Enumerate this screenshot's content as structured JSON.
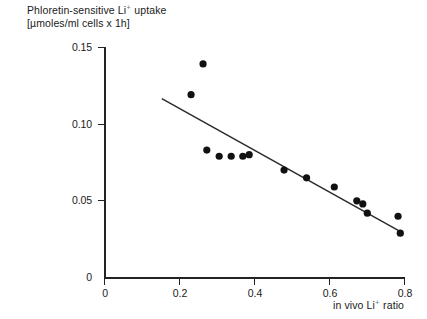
{
  "chart_data": {
    "type": "scatter",
    "title": "",
    "ylabel_line1": "Phloretin-sensitive Li",
    "ylabel_line1_sup": "+",
    "ylabel_line1_tail": "uptake",
    "ylabel_line2": "[µmoles/ml cells x 1h]",
    "xlabel_lead": "in vivo Li",
    "xlabel_sup": "+",
    "xlabel_tail": "ratio",
    "xlim": [
      0,
      0.8
    ],
    "ylim": [
      0,
      0.15
    ],
    "xticks": [
      0,
      0.2,
      0.4,
      0.6,
      0.8
    ],
    "xtick_labels": [
      "0",
      "0.2",
      "0.4",
      "0.6",
      "0.8"
    ],
    "yticks": [
      0,
      0.05,
      0.1,
      0.15
    ],
    "ytick_labels": [
      "0",
      "0.05",
      "0.10",
      "0.15"
    ],
    "grid": false,
    "legend": "none",
    "marker": "filled-circle",
    "marker_color": "#111111",
    "line_color": "#2b2b2b",
    "points": [
      {
        "x": 0.23,
        "y": 0.119
      },
      {
        "x": 0.262,
        "y": 0.139
      },
      {
        "x": 0.272,
        "y": 0.083
      },
      {
        "x": 0.305,
        "y": 0.079
      },
      {
        "x": 0.337,
        "y": 0.079
      },
      {
        "x": 0.368,
        "y": 0.079
      },
      {
        "x": 0.385,
        "y": 0.08
      },
      {
        "x": 0.478,
        "y": 0.07
      },
      {
        "x": 0.538,
        "y": 0.065
      },
      {
        "x": 0.612,
        "y": 0.059
      },
      {
        "x": 0.672,
        "y": 0.05
      },
      {
        "x": 0.688,
        "y": 0.048
      },
      {
        "x": 0.7,
        "y": 0.042
      },
      {
        "x": 0.782,
        "y": 0.04
      },
      {
        "x": 0.788,
        "y": 0.029
      }
    ],
    "fit_line": {
      "x_start": 0.152,
      "y_start": 0.1165,
      "x_end": 0.792,
      "y_end": 0.0295
    }
  }
}
